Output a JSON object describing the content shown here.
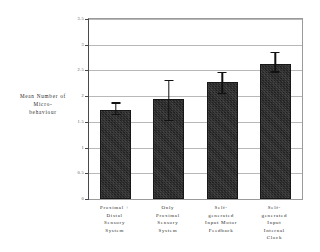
{
  "chart_data": {
    "type": "bar",
    "title": "",
    "subtitle": "",
    "xlabel": "",
    "ylabel": "Mean Number of Micro-behaviour",
    "ylabel_lines": [
      "Mean Number of",
      "Micro-",
      "behaviour"
    ],
    "categories": [
      "Proximal + Distal Sensory System",
      "Only Proximal Sensory System",
      "Self-generated Input Motor Feedback",
      "Self-generated Input Internal Clock"
    ],
    "category_lines": [
      [
        "Proximal +",
        "Distal",
        "Sensory",
        "System"
      ],
      [
        "Only",
        "Proximal",
        "Sensory",
        "System"
      ],
      [
        "Self-",
        "generated",
        "Input Motor",
        "Feedback"
      ],
      [
        "Self-",
        "generated",
        "Input",
        "Internal",
        "Clock"
      ]
    ],
    "values": [
      1.73,
      1.95,
      2.28,
      2.62
    ],
    "error_upper": [
      1.88,
      2.31,
      2.47,
      2.86
    ],
    "error_lower": [
      1.66,
      1.54,
      2.06,
      2.48
    ],
    "ylim": [
      0,
      3.5
    ],
    "yticks": [
      0,
      0.5,
      1,
      1.5,
      2,
      2.5,
      3,
      3.5
    ],
    "ytick_labels": [
      "0",
      "0.5",
      "1",
      "1.5",
      "2",
      "2.5",
      "3",
      "3.5"
    ],
    "grid": true,
    "grid_axis": "y",
    "legend": "none",
    "bar_color": "#333333",
    "errorbar_color": "#111111",
    "gridline_color": "#b8b8b8",
    "axis_color": "#4a4a4a",
    "background_color": "#ffffff"
  }
}
